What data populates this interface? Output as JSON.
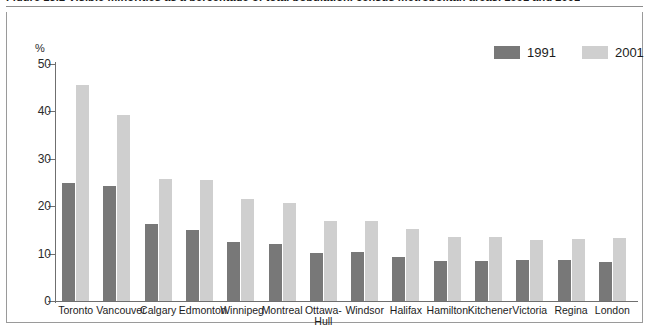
{
  "figure": {
    "title": "Figure 13.2  Visible minorities as a percentage of total population, census metropolitan areas, 1991 and 2001",
    "y_unit": "%"
  },
  "legend": {
    "position": "top-right",
    "items": [
      {
        "label": "1991",
        "color": "#787878"
      },
      {
        "label": "2001",
        "color": "#cfcfcf"
      }
    ]
  },
  "chart_data": {
    "type": "bar",
    "title": "Figure 13.2  Visible minorities as a percentage of total population, census metropolitan areas, 1991 and 2001",
    "xlabel": "",
    "ylabel": "%",
    "ylim": [
      0,
      50
    ],
    "yticks": [
      0,
      10,
      20,
      30,
      40,
      50
    ],
    "grid": false,
    "legend": [
      "1991",
      "2001"
    ],
    "categories": [
      "Toronto",
      "Vancouver",
      "Calgary",
      "Edmonton",
      "Winnipeg",
      "Montreal",
      "Ottawa-\nHull",
      "Windsor",
      "Halifax",
      "Hamilton",
      "Kitchener",
      "Victoria",
      "Regina",
      "London"
    ],
    "series": [
      {
        "name": "1991",
        "color": "#787878",
        "values": [
          25.0,
          24.3,
          16.3,
          14.9,
          12.4,
          12.0,
          10.2,
          10.3,
          9.2,
          8.4,
          8.5,
          8.6,
          8.7,
          8.2
        ]
      },
      {
        "name": "2001",
        "color": "#cfcfcf",
        "values": [
          45.5,
          39.2,
          25.7,
          25.6,
          21.6,
          20.7,
          16.9,
          16.9,
          15.2,
          13.4,
          13.6,
          12.8,
          13.0,
          13.2
        ]
      }
    ]
  }
}
